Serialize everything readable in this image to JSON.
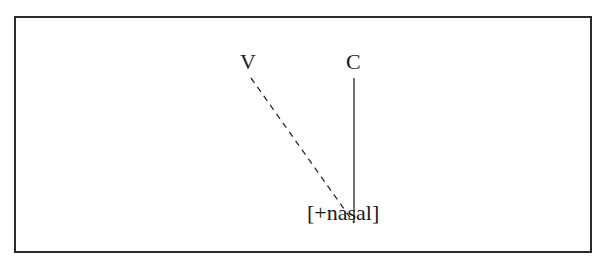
{
  "diagram": {
    "type": "autosegmental-association",
    "nodes": {
      "v": {
        "label": "V",
        "x": 251,
        "y": 62
      },
      "c": {
        "label": "C",
        "x": 354,
        "y": 62
      },
      "feature": {
        "label": "[+nasal]",
        "x": 352,
        "y": 213
      }
    },
    "edges": [
      {
        "from": "v",
        "to": "feature",
        "style": "dashed",
        "x1": 251,
        "y1": 78,
        "x2": 354,
        "y2": 223
      },
      {
        "from": "c",
        "to": "feature",
        "style": "solid",
        "x1": 354,
        "y1": 78,
        "x2": 354,
        "y2": 223
      }
    ],
    "colors": {
      "line": "#2a2a2a",
      "text": "#1a1a1a",
      "border": "#2a2a2a",
      "background": "#ffffff"
    }
  }
}
